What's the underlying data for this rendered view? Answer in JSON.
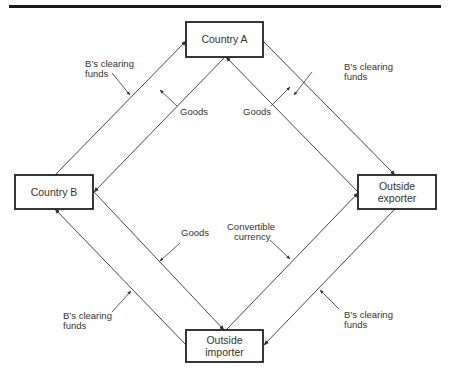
{
  "diagram": {
    "rule_color": "#1a1a1a",
    "line_color": "#333333",
    "nodes": {
      "country_a": {
        "label_lines": [
          "Country A"
        ]
      },
      "country_b": {
        "label_lines": [
          "Country B"
        ]
      },
      "outside_exporter": {
        "label_lines": [
          "Outside",
          "exporter"
        ]
      },
      "outside_importer": {
        "label_lines": [
          "Outside",
          "importer"
        ]
      }
    },
    "flows": [
      {
        "from": "Country B",
        "to": "Country A",
        "label_lines": [
          "B’s clearing",
          "funds"
        ]
      },
      {
        "from": "Country A",
        "to": "Country B",
        "label_lines": [
          "Goods"
        ]
      },
      {
        "from": "Country A",
        "to": "Outside exporter",
        "label_lines": [
          "B’s clearing",
          "funds"
        ]
      },
      {
        "from": "Outside exporter",
        "to": "Country A",
        "label_lines": [
          "Goods"
        ]
      },
      {
        "from": "Country B",
        "to": "Outside importer",
        "label_lines": [
          "Goods"
        ]
      },
      {
        "from": "Outside importer",
        "to": "Country B",
        "label_lines": [
          "B’s clearing",
          "funds"
        ]
      },
      {
        "from": "Outside importer",
        "to": "Outside exporter",
        "label_lines": [
          "Convertible",
          "currency"
        ]
      },
      {
        "from": "Outside exporter",
        "to": "Outside importer",
        "label_lines": [
          "B’s clearing",
          "funds"
        ]
      }
    ]
  }
}
